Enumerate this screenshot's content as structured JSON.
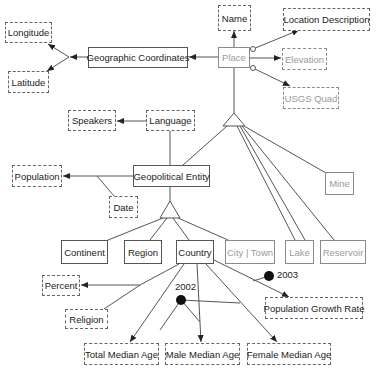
{
  "diagram": {
    "type": "entity-relationship",
    "entities": {
      "geographic_coordinates": "Geographic Coordinates",
      "place": "Place",
      "geopolitical_entity": "Geopolitical Entity",
      "continent": "Continent",
      "region": "Region",
      "country": "Country",
      "city_town": "City | Town",
      "lake": "Lake",
      "reservoir": "Reservoir",
      "mine": "Mine"
    },
    "attributes": {
      "longitude": "Longitude",
      "latitude": "Latitude",
      "name": "Name",
      "location_description": "Location Description",
      "elevation": "Elevation",
      "usgs_quad": "USGS Quad",
      "speakers": "Speakers",
      "language": "Language",
      "population": "Population",
      "date": "Date",
      "percent": "Percent",
      "religion": "Religion",
      "population_growth_rate": "Population Growth Rate",
      "total_median_age": "Total Median Age",
      "male_median_age": "Male Median Age",
      "female_median_age": "Female Median Age"
    },
    "annotations": {
      "year_2002": "2002",
      "year_2003": "2003"
    },
    "colors": {
      "line": "#555555",
      "gray_text": "#9a9a9a",
      "dot": "#111111"
    }
  }
}
